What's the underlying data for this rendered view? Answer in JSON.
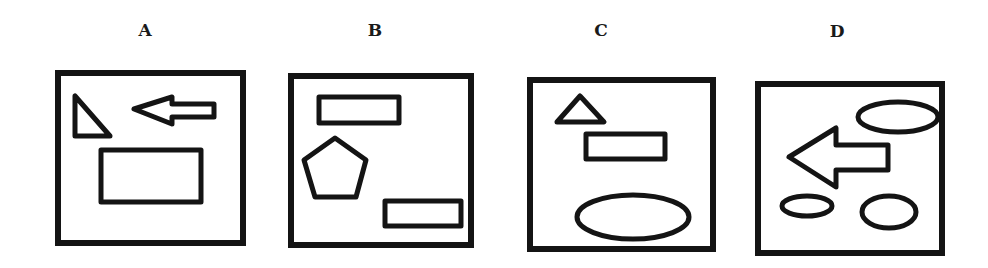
{
  "panels": [
    {
      "label": "A",
      "label_pos": [
        145,
        32
      ],
      "frame": {
        "x": 58,
        "y": 73,
        "w": 185,
        "h": 170
      },
      "shapes": [
        {
          "kind": "right-triangle",
          "name": "triangle",
          "points": "75,96 75,136 110,136"
        },
        {
          "kind": "arrow-left",
          "name": "left-arrow",
          "points": "134,109 172,97 172,104 214,104 214,117 172,117 172,124"
        },
        {
          "kind": "rectangle",
          "name": "rectangle",
          "x": 101,
          "y": 150,
          "w": 100,
          "h": 52
        }
      ]
    },
    {
      "label": "B",
      "label_pos": [
        375,
        32
      ],
      "frame": {
        "x": 291,
        "y": 76,
        "w": 180,
        "h": 169
      },
      "shapes": [
        {
          "kind": "rectangle",
          "name": "upper-rectangle",
          "x": 319,
          "y": 97,
          "w": 80,
          "h": 26
        },
        {
          "kind": "pentagon",
          "name": "pentagon",
          "points": "335,138 366,160 356,197 315,197 304,160"
        },
        {
          "kind": "rectangle",
          "name": "lower-rectangle",
          "x": 385,
          "y": 201,
          "w": 76,
          "h": 25
        }
      ]
    },
    {
      "label": "C",
      "label_pos": [
        601,
        32
      ],
      "frame": {
        "x": 530,
        "y": 80,
        "w": 183,
        "h": 169
      },
      "shapes": [
        {
          "kind": "triangle",
          "name": "triangle",
          "points": "580,96 604,122 557,122"
        },
        {
          "kind": "rectangle",
          "name": "rectangle",
          "x": 586,
          "y": 134,
          "w": 79,
          "h": 25
        },
        {
          "kind": "ellipse",
          "name": "ellipse",
          "cx": 633,
          "cy": 217,
          "rx": 56,
          "ry": 22
        }
      ]
    },
    {
      "label": "D",
      "label_pos": [
        837,
        33
      ],
      "frame": {
        "x": 758,
        "y": 84,
        "w": 184,
        "h": 169
      },
      "shapes": [
        {
          "kind": "ellipse",
          "name": "top-ellipse",
          "cx": 898,
          "cy": 117,
          "rx": 40,
          "ry": 15
        },
        {
          "kind": "arrow-left",
          "name": "left-arrow",
          "points": "789,157 836,128 836,145 888,145 888,170 836,170 836,187"
        },
        {
          "kind": "ellipse",
          "name": "small-ellipse",
          "cx": 807,
          "cy": 206,
          "rx": 25,
          "ry": 10
        },
        {
          "kind": "ellipse",
          "name": "right-ellipse",
          "cx": 889,
          "cy": 212,
          "rx": 27,
          "ry": 16
        }
      ]
    }
  ],
  "style": {
    "stroke": "#141414",
    "frame_stroke_width": 6,
    "shape_stroke_width": 5
  }
}
